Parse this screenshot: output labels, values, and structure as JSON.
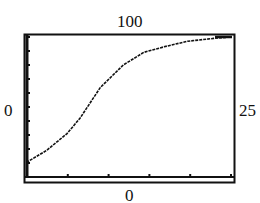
{
  "chart_data": {
    "type": "line",
    "title": "",
    "xlabel": "",
    "ylabel": "",
    "window": {
      "xmin": 0,
      "xmax": 25,
      "ymin": 0,
      "ymax": 100,
      "xscl": 5,
      "yscl": 10
    },
    "labels": {
      "ymax": "100",
      "ymin": "0",
      "xmin": "0",
      "xmax": "25"
    },
    "xlim": [
      0,
      25
    ],
    "ylim": [
      0,
      100
    ],
    "grid": false,
    "series": [
      {
        "name": "logistic curve",
        "x": [
          0,
          0.1,
          2.4,
          4.9,
          6.5,
          9.0,
          11.8,
          14.3,
          16.8,
          19.7,
          22.9,
          25
        ],
        "y": [
          10,
          11,
          19,
          31,
          42,
          64,
          80,
          89,
          93,
          97,
          99,
          100
        ]
      }
    ],
    "plot_px": {
      "x0": 27,
      "x1": 231,
      "y0": 177,
      "y1": 37
    }
  }
}
